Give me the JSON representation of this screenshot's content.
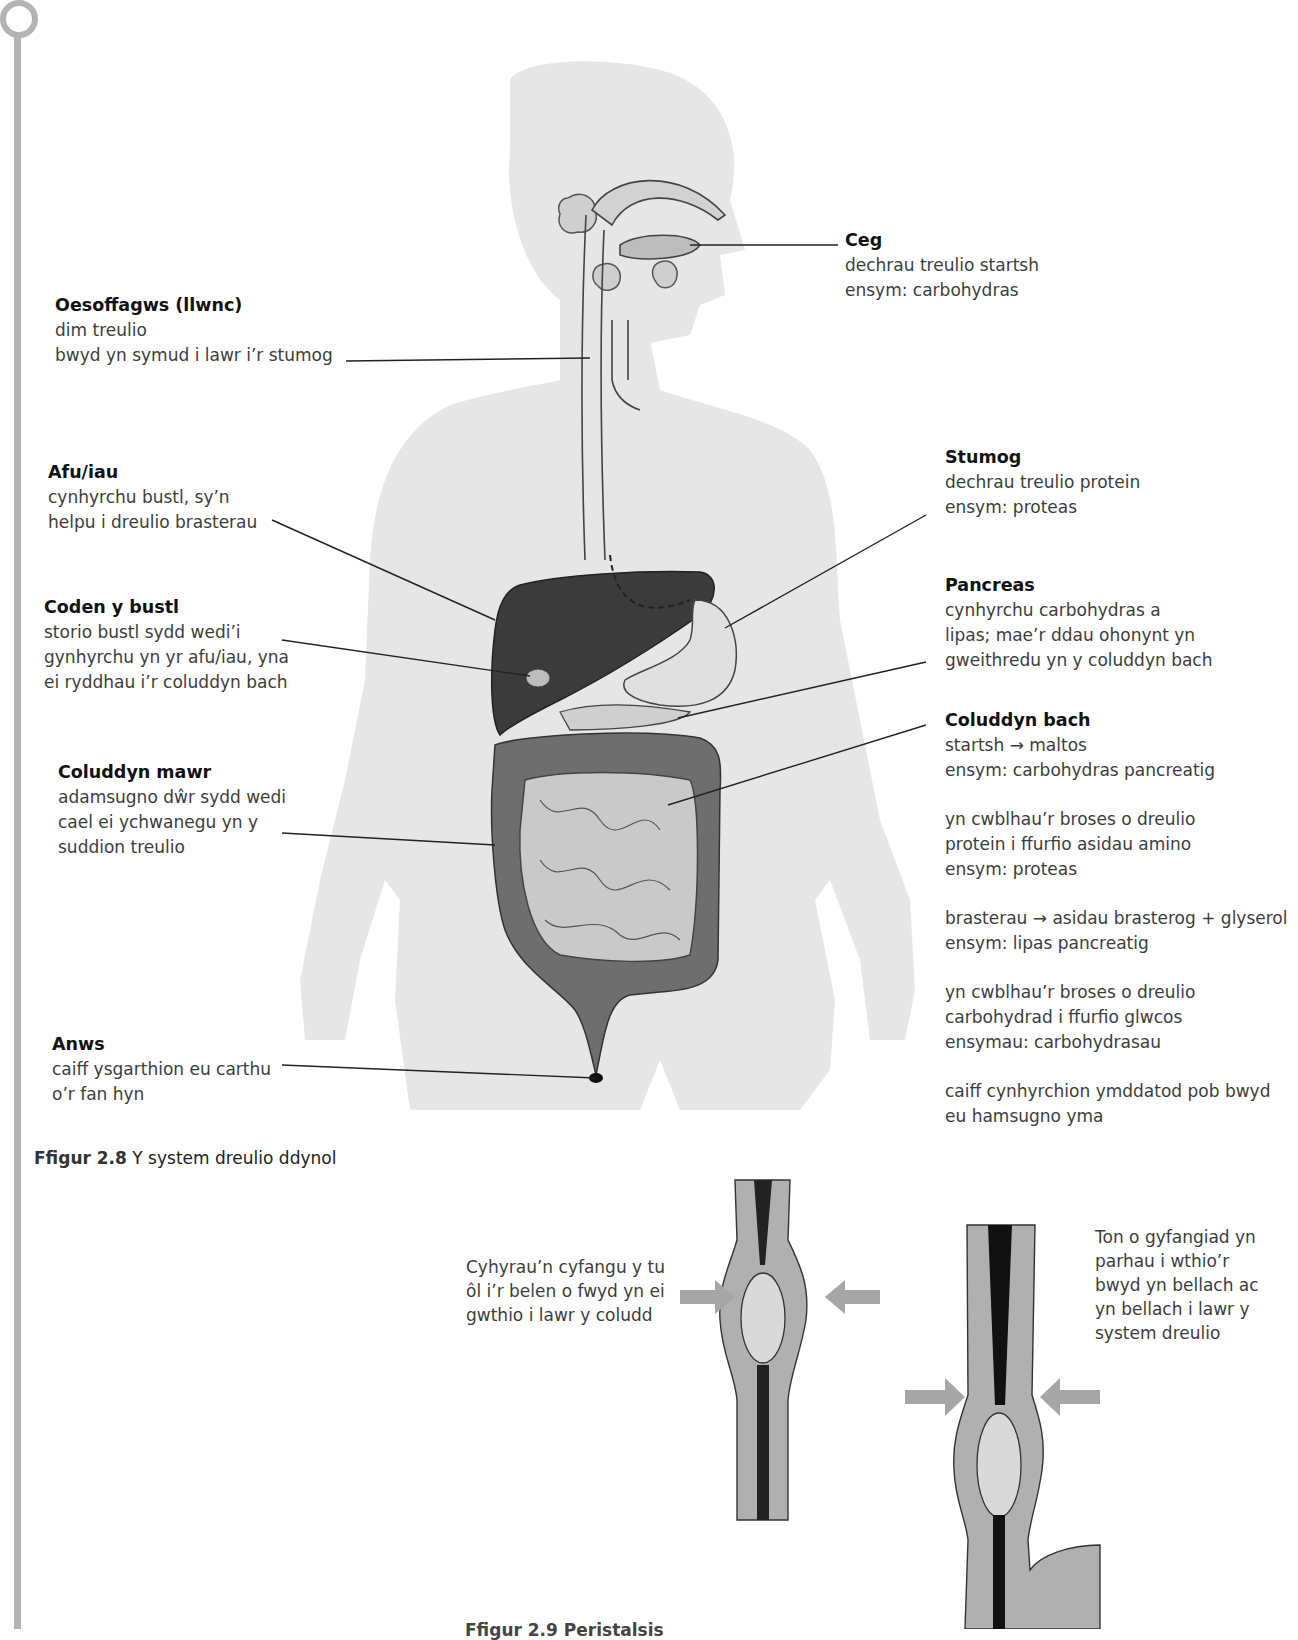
{
  "figure_2_8": {
    "caption_number": "Ffigur 2.8",
    "caption_text": "Y system dreulio ddynol",
    "labels": {
      "oesoffagws": {
        "title": "Oesoffagws (llwnc)",
        "lines": [
          "dim treulio",
          "bwyd yn symud i lawr i’r stumog"
        ]
      },
      "ceg": {
        "title": "Ceg",
        "lines": [
          "dechrau treulio startsh",
          "ensym: carbohydras"
        ]
      },
      "afu": {
        "title": "Afu/iau",
        "lines": [
          "cynhyrchu bustl, sy’n",
          "helpu i dreulio brasterau"
        ]
      },
      "coden": {
        "title": "Coden y bustl",
        "lines": [
          "storio bustl sydd wedi’i",
          "gynhyrchu yn yr afu/iau, yna",
          "ei ryddhau i’r coluddyn bach"
        ]
      },
      "coluddyn_mawr": {
        "title": "Coluddyn mawr",
        "lines": [
          "adamsugno dŵr sydd wedi",
          "cael ei ychwanegu yn y",
          "suddion treulio"
        ]
      },
      "anws": {
        "title": "Anws",
        "lines": [
          "caiff ysgarthion eu carthu",
          "o’r fan hyn"
        ]
      },
      "stumog": {
        "title": "Stumog",
        "lines": [
          "dechrau treulio protein",
          "ensym: proteas"
        ]
      },
      "pancreas": {
        "title": "Pancreas",
        "lines": [
          "cynhyrchu carbohydras a",
          "lipas; mae’r ddau ohonynt yn",
          "gweithredu yn y coluddyn bach"
        ]
      },
      "coluddyn_bach": {
        "title": "Coluddyn bach",
        "blocks": [
          [
            "startsh → maltos",
            "ensym: carbohydras pancreatig"
          ],
          [
            "yn cwblhau’r broses o dreulio",
            "protein i ffurfio asidau amino",
            "ensym: proteas"
          ],
          [
            "brasterau → asidau brasterog + glyserol",
            "ensym: lipas pancreatig"
          ],
          [
            "yn cwblhau’r broses o dreulio",
            "carbohydrad i ffurfio glwcos",
            "ensymau: carbohydrasau"
          ],
          [
            "caiff cynhyrchion ymddatod pob bwyd",
            "eu hamsugno yma"
          ]
        ]
      }
    }
  },
  "figure_2_9": {
    "left_text": [
      "Cyhyrau’n cyfangu y tu",
      "ôl i’r belen o fwyd yn ei",
      "gwthio i lawr y coludd"
    ],
    "right_text": [
      "Ton o gyfangiad yn",
      "parhau i wthio’r",
      "bwyd yn bellach ac",
      "yn bellach i lawr y",
      "system dreulio"
    ],
    "caption_partial": "Ffigur 2.9 Peristalsis"
  },
  "colors": {
    "body_silhouette": "#e6e6e6",
    "liver": "#3b3b3b",
    "large_intestine": "#6e6e6e",
    "small_intestine": "#c9c9c9",
    "arrow": "#a6a6a6",
    "rail": "#b3b3b3"
  }
}
